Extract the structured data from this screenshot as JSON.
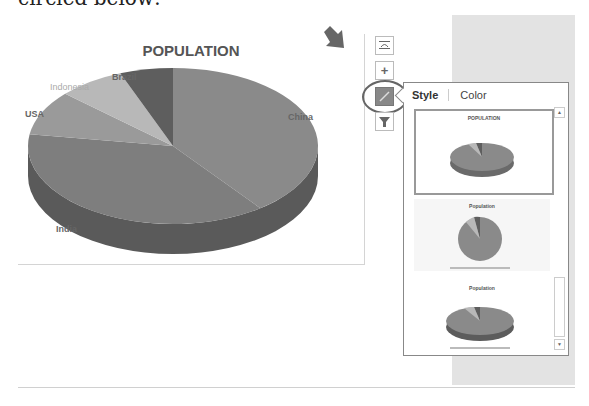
{
  "caption": "circled below:",
  "chart": {
    "title": "POPULATION",
    "labels": {
      "brazil": "Brazil",
      "indonesia": "Indonesia",
      "usa": "USA",
      "china": "China",
      "india": "India"
    }
  },
  "chart_data": {
    "type": "pie",
    "title": "POPULATION",
    "categories": [
      "China",
      "India",
      "USA",
      "Indonesia",
      "Brazil"
    ],
    "values": [
      1380,
      1310,
      322,
      258,
      206
    ],
    "colors": [
      "#8a8a8a",
      "#7e7e7e",
      "#9a9a9a",
      "#b8b8b8",
      "#5e5e5e"
    ]
  },
  "side_buttons": {
    "layout": "chart-elements-layout",
    "add": "+",
    "style": "chart-styles",
    "filter": "chart-filters"
  },
  "popup": {
    "tabs": [
      {
        "label": "Style"
      },
      {
        "label": "Color"
      }
    ],
    "thumbnails": [
      {
        "title": "POPULATION"
      },
      {
        "title": "Population"
      },
      {
        "title": "Population"
      }
    ],
    "scroll_up": "▲",
    "scroll_down": "▼"
  }
}
